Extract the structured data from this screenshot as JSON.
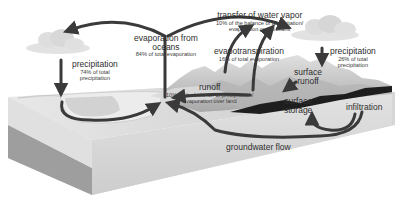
{
  "diagram": {
    "type": "water-cycle",
    "labels": {
      "evaporation_oceans": {
        "title": "evaporation from oceans",
        "line1": "evaporation from",
        "line2": "oceans",
        "sub": "84% of total evaporation"
      },
      "precipitation_ocean": {
        "title": "precipitation",
        "sub1": "74% of total",
        "sub2": "precipitation"
      },
      "transfer_vapor": {
        "title": "transfer of water vapor",
        "sub1": "10% of the balance of precipitation/",
        "sub2": "evaporation over oceans"
      },
      "evapotranspiration": {
        "title": "evapotranspiration",
        "sub": "16% of total evaporation"
      },
      "precipitation_land": {
        "title": "precipitation",
        "sub1": "26% of total",
        "sub2": "precipitation"
      },
      "surface_runoff": {
        "line1": "surface",
        "line2": "runoff"
      },
      "runoff": {
        "title": "runoff",
        "sub1": "10% of the balance of precipitation/",
        "sub2": "evaporation over land"
      },
      "surface_storage": {
        "line1": "surface",
        "line2": "storage"
      },
      "infiltration": {
        "title": "infiltration"
      },
      "groundwater_flow": {
        "title": "groundwater flow"
      }
    },
    "colors": {
      "arrow": "#3a3a3a",
      "block_top": "#cfcfcf",
      "block_front": "#d9d9d9",
      "block_side": "#9a9a9a",
      "ocean": "#e6e6e6",
      "mountains": "#bdbdbd",
      "dark_land": "#1e1e1e",
      "cloud": "#dcdcdc",
      "text": "#2e2e2e"
    }
  }
}
